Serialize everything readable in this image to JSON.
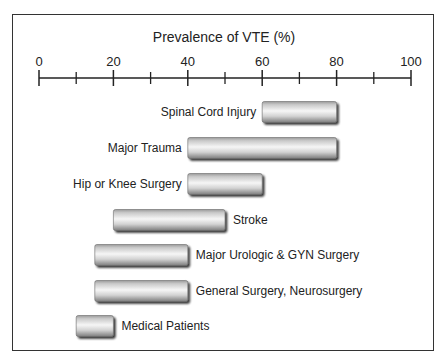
{
  "chart_data": {
    "type": "bar",
    "orientation": "horizontal-range",
    "title": "Prevalence of VTE (%)",
    "xlabel": "",
    "ylabel": "",
    "xlim": [
      0,
      100
    ],
    "x_ticks_major": [
      0,
      20,
      40,
      60,
      80,
      100
    ],
    "x_ticks_minor": [
      10,
      30,
      50,
      70,
      90
    ],
    "tick_labels": [
      "0",
      "20",
      "40",
      "60",
      "80",
      "100"
    ],
    "grid": false,
    "categories": [
      "Spinal Cord Injury",
      "Major Trauma",
      "Hip or Knee Surgery",
      "Stroke",
      "Major Urologic & GYN Surgery",
      "General Surgery, Neurosurgery",
      "Medical Patients"
    ],
    "ranges": [
      {
        "category": "Spinal Cord Injury",
        "low": 60,
        "high": 80,
        "label_side": "left"
      },
      {
        "category": "Major Trauma",
        "low": 40,
        "high": 80,
        "label_side": "left"
      },
      {
        "category": "Hip or Knee Surgery",
        "low": 40,
        "high": 60,
        "label_side": "left"
      },
      {
        "category": "Stroke",
        "low": 20,
        "high": 50,
        "label_side": "right"
      },
      {
        "category": "Major Urologic & GYN Surgery",
        "low": 15,
        "high": 40,
        "label_side": "right"
      },
      {
        "category": "General Surgery, Neurosurgery",
        "low": 15,
        "high": 40,
        "label_side": "right"
      },
      {
        "category": "Medical Patients",
        "low": 10,
        "high": 20,
        "label_side": "right"
      }
    ],
    "colors": {
      "bar_light": "#f4f4f4",
      "bar_mid": "#c8c8c8",
      "bar_dark": "#8a8a8a",
      "shadow": "#3a3a3a",
      "axis": "#222222"
    }
  }
}
